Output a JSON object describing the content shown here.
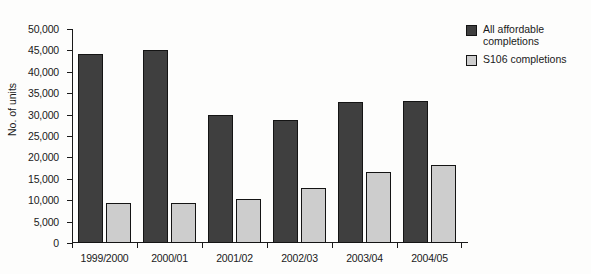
{
  "chart_data": {
    "type": "bar",
    "title": "",
    "xlabel": "",
    "ylabel": "No. of units",
    "ylim": [
      0,
      50000
    ],
    "ytick_step": 5000,
    "yticks": [
      "0",
      "5,000",
      "10,000",
      "15,000",
      "20,000",
      "25,000",
      "30,000",
      "35,000",
      "40,000",
      "45,000",
      "50,000"
    ],
    "grid": false,
    "legend_position": "top-right",
    "categories": [
      "1999/2000",
      "2000/01",
      "2001/02",
      "2002/03",
      "2003/04",
      "2004/05"
    ],
    "series": [
      {
        "name": "All affordable completions",
        "color": "#3f3f3f",
        "values": [
          44200,
          45000,
          29800,
          28700,
          32900,
          33200
        ]
      },
      {
        "name": "S106 completions",
        "color": "#cdcdcd",
        "values": [
          9300,
          9300,
          10200,
          12800,
          16500,
          18300
        ]
      }
    ]
  },
  "legend": {
    "items": [
      {
        "label": "All affordable completions",
        "swatch": "dark"
      },
      {
        "label": "S106 completions",
        "swatch": "light"
      }
    ]
  },
  "title_remnant": ""
}
